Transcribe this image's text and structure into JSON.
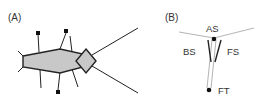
{
  "panels": {
    "a": {
      "label": "(A)"
    },
    "b": {
      "label": "(B)",
      "labels": {
        "as": "AS",
        "bs": "BS",
        "fs": "FS",
        "ft": "FT"
      }
    }
  },
  "colors": {
    "body_fill": "#c8c8c8",
    "stroke": "#222222",
    "gray_line": "#b4b4b4"
  }
}
